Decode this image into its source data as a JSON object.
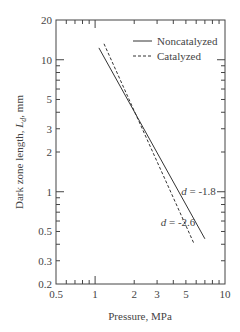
{
  "chart_data": {
    "type": "line",
    "title": "",
    "xlabel": "Pressure, MPa",
    "ylabel": "Dark zone length, L_d, mm",
    "ylabel_parts": {
      "prefix": "Dark  zone  length,  ",
      "var": "L",
      "sub": "d",
      "suffix": ",  mm"
    },
    "xscale": "log",
    "yscale": "log",
    "xlim": [
      0.5,
      10
    ],
    "ylim": [
      0.2,
      20
    ],
    "xticks": [
      0.5,
      1,
      2,
      3,
      5,
      10
    ],
    "xtick_labels": [
      "0.5",
      "1",
      "2",
      "3",
      "5",
      "10"
    ],
    "yticks": [
      0.2,
      0.3,
      0.5,
      1,
      2,
      3,
      5,
      10,
      20
    ],
    "ytick_labels": [
      "0.2",
      "0.3",
      "0.5",
      "1",
      "2",
      "3",
      "5",
      "10",
      "20"
    ],
    "grid": false,
    "legend_position": "upper right",
    "series": [
      {
        "name": "Noncatalyzed",
        "style": "solid",
        "x": [
          1.07,
          7.0
        ],
        "y": [
          12.3,
          0.44
        ],
        "slope_label": "d = -1.8"
      },
      {
        "name": "Catalyzed",
        "style": "dashed",
        "x": [
          1.17,
          5.8
        ],
        "y": [
          13.2,
          0.4
        ],
        "slope_label": "d = -2.6"
      }
    ],
    "annotations": [
      {
        "text_var": "d",
        "text_rest": " = -1.8",
        "x": 4.6,
        "y": 0.95
      },
      {
        "text_var": "d",
        "text_rest": " = -2.6",
        "x": 3.2,
        "y": 0.55
      }
    ]
  },
  "legend": {
    "items": [
      {
        "label": "Noncatalyzed"
      },
      {
        "label": "Catalyzed"
      }
    ]
  },
  "colors": {
    "line": "#333333",
    "axis": "#444444"
  }
}
